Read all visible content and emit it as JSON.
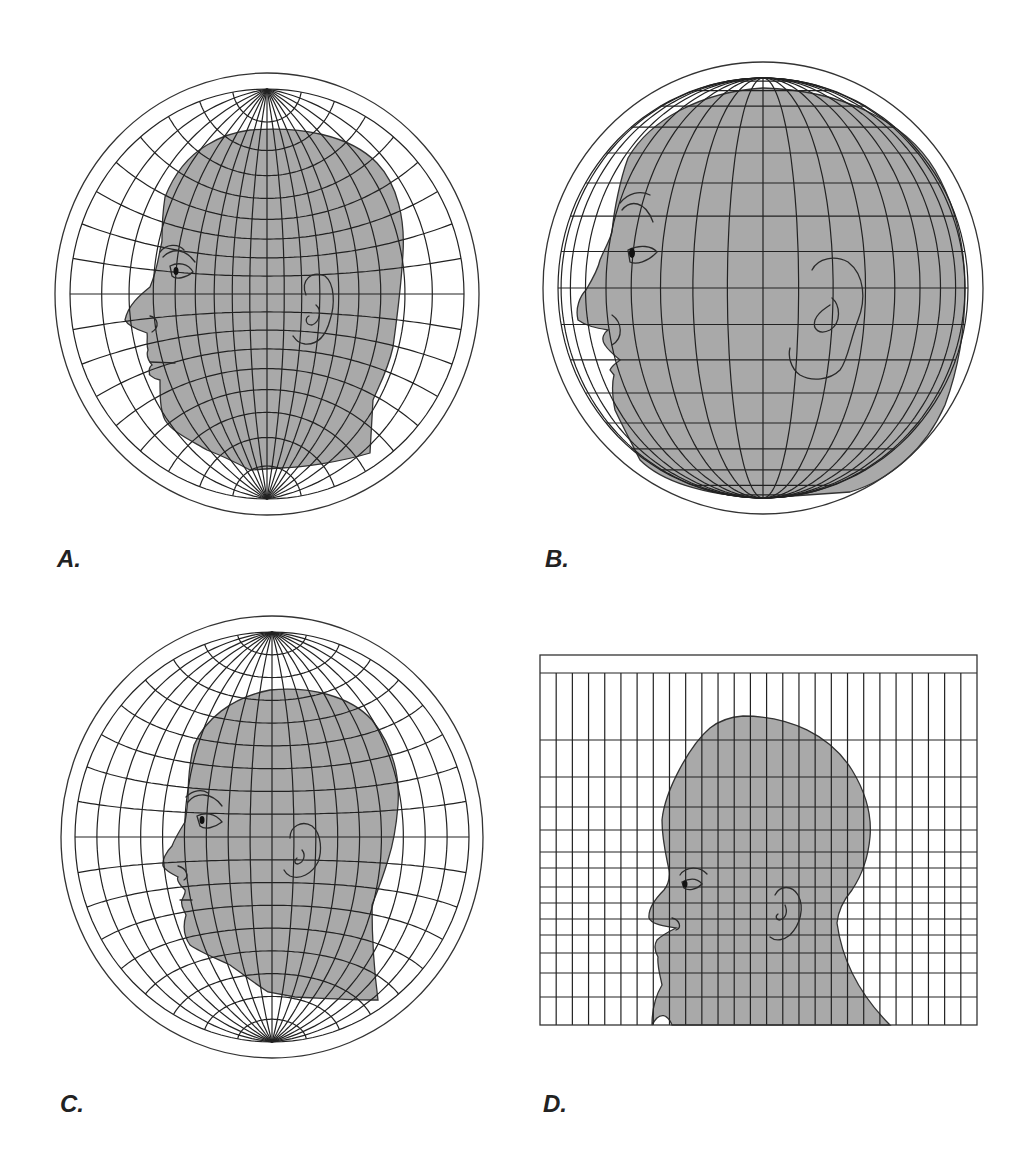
{
  "figure": {
    "panels": [
      {
        "id": "a",
        "label": "A."
      },
      {
        "id": "b",
        "label": "B."
      },
      {
        "id": "c",
        "label": "C."
      },
      {
        "id": "d",
        "label": "D."
      }
    ],
    "colors": {
      "background": "#ffffff",
      "face_fill": "#a9a9a9",
      "line": "#222222"
    }
  }
}
